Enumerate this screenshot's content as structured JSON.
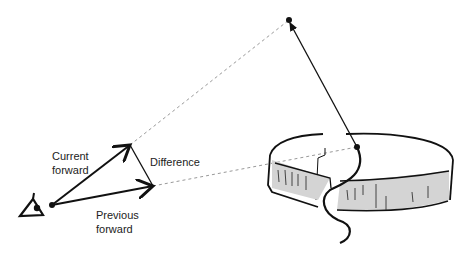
{
  "diagram": {
    "labels": {
      "current": [
        "Current",
        "forward"
      ],
      "difference": "Difference",
      "previous": [
        "Previous",
        "forward"
      ]
    },
    "colors": {
      "stroke": "#111111",
      "dashed": "#999999",
      "cheese_side": "#d4d4d4"
    }
  }
}
